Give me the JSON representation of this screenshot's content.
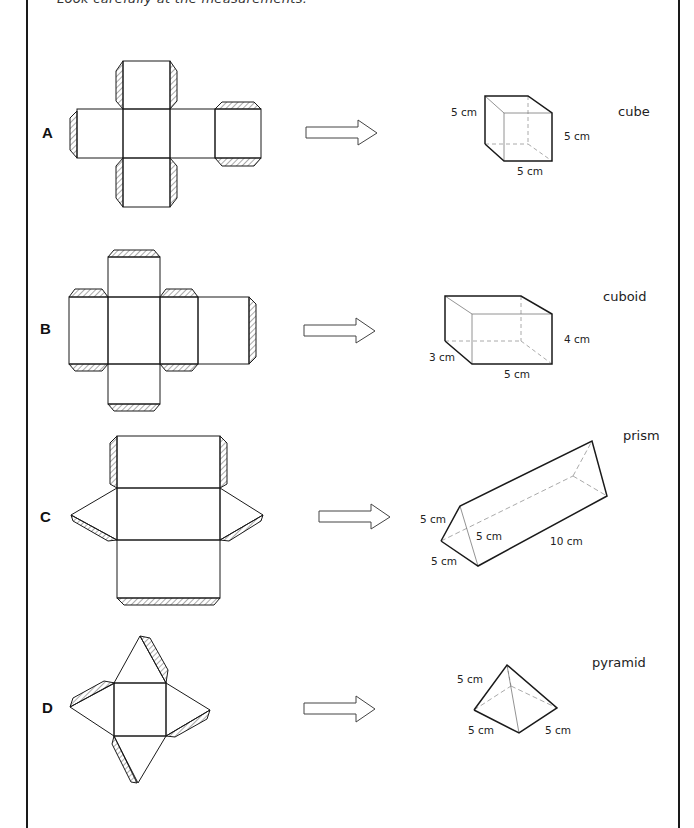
{
  "instruction": "Look carefully at the measurements.",
  "rows": [
    {
      "label": "A",
      "shape_name": "cube",
      "dimensions": [
        "5 cm",
        "5 cm",
        "5 cm"
      ],
      "net": "cube-net",
      "arrow": "arrow-right"
    },
    {
      "label": "B",
      "shape_name": "cuboid",
      "dimensions": [
        "4 cm",
        "3 cm",
        "5 cm"
      ],
      "net": "cuboid-net",
      "arrow": "arrow-right"
    },
    {
      "label": "C",
      "shape_name": "prism",
      "dimensions": [
        "5 cm",
        "5 cm",
        "5 cm",
        "10 cm"
      ],
      "net": "triangular-prism-net",
      "arrow": "arrow-right"
    },
    {
      "label": "D",
      "shape_name": "pyramid",
      "dimensions": [
        "5 cm",
        "5 cm",
        "5 cm"
      ],
      "net": "square-pyramid-net",
      "arrow": "arrow-right"
    }
  ],
  "colors": {
    "line": "#1a1a1a",
    "hidden_edge": "#aaaaaa",
    "hatch": "#555555"
  }
}
